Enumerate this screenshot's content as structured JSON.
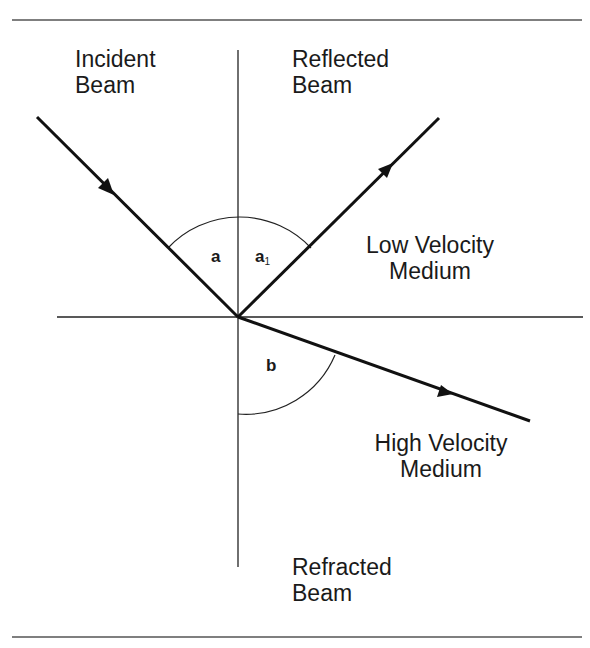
{
  "diagram": {
    "labels": {
      "incident": [
        "Incident",
        "Beam"
      ],
      "reflected": [
        "Reflected",
        "Beam"
      ],
      "low_medium": [
        "Low Velocity",
        "Medium"
      ],
      "high_medium": [
        "High Velocity",
        "Medium"
      ],
      "refracted": [
        "Refracted",
        "Beam"
      ]
    },
    "angles": {
      "incidence": "a",
      "reflection": "a",
      "reflection_subscript": "1",
      "refraction": "b"
    },
    "colors": {
      "ink": "#1a1a1a",
      "background": "#ffffff"
    }
  }
}
